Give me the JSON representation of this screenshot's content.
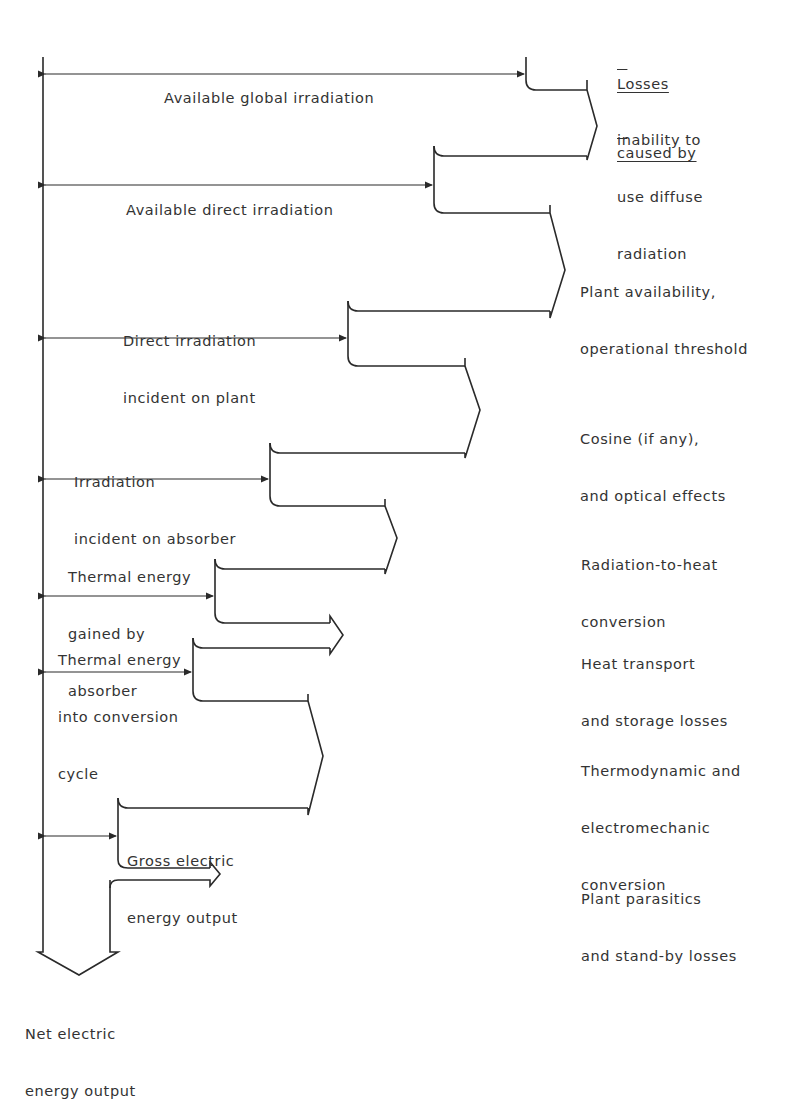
{
  "diagram": {
    "line_color": "#2a2a2a",
    "losses_header": [
      "Losses",
      "caused by"
    ],
    "stages": [
      {
        "id": "global",
        "label": [
          "Available global irradiation"
        ]
      },
      {
        "id": "direct",
        "label": [
          "Available direct irradiation"
        ]
      },
      {
        "id": "plant",
        "label": [
          "Direct irradiation",
          "incident on plant"
        ]
      },
      {
        "id": "absorber",
        "label": [
          "Irradiation",
          "incident on absorber"
        ]
      },
      {
        "id": "thermal_gained",
        "label": [
          "Thermal energy",
          "gained by",
          "absorber"
        ]
      },
      {
        "id": "thermal_cycle",
        "label": [
          "Thermal energy",
          "into conversion",
          "cycle"
        ]
      },
      {
        "id": "gross",
        "label": [
          "Gross electric",
          "energy output"
        ]
      },
      {
        "id": "net",
        "label": [
          "Net electric",
          "energy output"
        ]
      }
    ],
    "losses": [
      {
        "id": "diffuse",
        "label": [
          "inability to",
          "use diffuse",
          "radiation"
        ]
      },
      {
        "id": "availability",
        "label": [
          "Plant availability,",
          "operational threshold"
        ]
      },
      {
        "id": "optical",
        "label": [
          "Cosine (if any),",
          "and optical effects"
        ]
      },
      {
        "id": "rad_heat",
        "label": [
          "Radiation-to-heat",
          "conversion"
        ]
      },
      {
        "id": "transport",
        "label": [
          "Heat transport",
          "and storage losses"
        ]
      },
      {
        "id": "thermo",
        "label": [
          "Thermodynamic and",
          "electromechanic",
          "conversion"
        ]
      },
      {
        "id": "parasitics",
        "label": [
          "Plant parasitics",
          "and stand-by losses"
        ]
      }
    ]
  }
}
